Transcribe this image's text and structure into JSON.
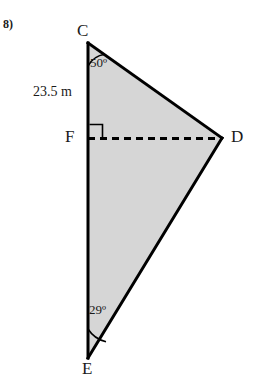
{
  "problem": {
    "number": "8)"
  },
  "figure": {
    "vertices": [
      {
        "id": "C",
        "label": "C",
        "x": 88,
        "y": 43
      },
      {
        "id": "D",
        "label": "D",
        "x": 222,
        "y": 138
      },
      {
        "id": "E",
        "label": "E",
        "x": 88,
        "y": 358
      },
      {
        "id": "F",
        "label": "F",
        "x": 88,
        "y": 138
      }
    ],
    "side_labels": [
      {
        "id": "CF",
        "text": "23.5 m"
      }
    ],
    "angle_labels": [
      {
        "id": "angle-C",
        "text": "50º",
        "degrees": 50,
        "at_vertex": "C"
      },
      {
        "id": "angle-E",
        "text": "29º",
        "degrees": 29,
        "at_vertex": "E"
      }
    ],
    "right_angle": {
      "at_vertex": "F",
      "marker": "square"
    },
    "segments": [
      {
        "id": "CE",
        "from": "C",
        "to": "E",
        "style": "solid"
      },
      {
        "id": "CD",
        "from": "C",
        "to": "D",
        "style": "solid"
      },
      {
        "id": "DE",
        "from": "D",
        "to": "E",
        "style": "solid"
      },
      {
        "id": "FD",
        "from": "F",
        "to": "D",
        "style": "dashed"
      }
    ],
    "colors": {
      "fill": "#d6d6d6",
      "stroke": "#000000",
      "text": "#1a1a1a",
      "background": "#ffffff"
    }
  }
}
